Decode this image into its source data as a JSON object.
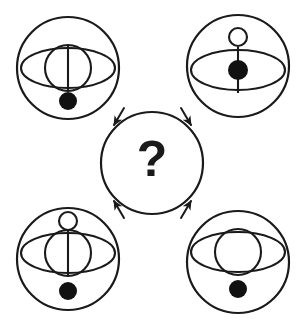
{
  "puzzle": {
    "title": "Visual analogy puzzle",
    "type": "matrix-reasoning",
    "question_mark": "?",
    "canvas": {
      "width": 305,
      "height": 324
    },
    "style": {
      "stroke_color": "#1a1a1a",
      "fill_color": "#1a1a1a",
      "background_color": "#ffffff",
      "stroke_width": 2.1,
      "dot_color": "#111111"
    },
    "center": {
      "name": "answer-circle",
      "label": "?",
      "cx": 152,
      "cy": 163,
      "r": 51
    },
    "arrows": [
      {
        "name": "arrow-from-top-left",
        "x1": 124,
        "y1": 108,
        "x2": 114,
        "y2": 125,
        "direction": "down-right"
      },
      {
        "name": "arrow-from-top-right",
        "x1": 181,
        "y1": 108,
        "x2": 191,
        "y2": 125,
        "direction": "down-left"
      },
      {
        "name": "arrow-from-bottom-left",
        "x1": 124,
        "y1": 218,
        "x2": 114,
        "y2": 201,
        "direction": "up-right"
      },
      {
        "name": "arrow-from-bottom-right",
        "x1": 181,
        "y1": 218,
        "x2": 191,
        "y2": 201,
        "direction": "up-left"
      }
    ],
    "symbols": [
      {
        "name": "symbol-top-left",
        "position": "top-left",
        "outer_circle": {
          "cx": 68,
          "cy": 68,
          "r": 51
        },
        "ellipse": {
          "cx": 68,
          "cy": 68,
          "rx": 47,
          "ry": 20
        },
        "inner_circle": {
          "cx": 68,
          "cy": 68,
          "r": 23,
          "present": true
        },
        "vertical_line": {
          "present": true,
          "x": 68,
          "y1": 45,
          "y2": 91
        },
        "open_circle_top": {
          "present": false,
          "cx": 68,
          "cy": 34,
          "r": 9
        },
        "filled_dot": {
          "present": true,
          "cx": 68,
          "cy": 101,
          "r": 9,
          "location": "below-ellipse"
        },
        "features": [
          "outer-circle",
          "ellipse",
          "inner-circle",
          "vertical-line",
          "dot-below"
        ]
      },
      {
        "name": "symbol-top-right",
        "position": "top-right",
        "outer_circle": {
          "cx": 238,
          "cy": 66,
          "r": 51
        },
        "ellipse": {
          "cx": 238,
          "cy": 70,
          "rx": 47,
          "ry": 20
        },
        "inner_circle": {
          "cx": 238,
          "cy": 70,
          "r": 23,
          "present": false
        },
        "vertical_line": {
          "present": true,
          "x": 238,
          "y1": 47,
          "y2": 93
        },
        "open_circle_top": {
          "present": true,
          "cx": 238,
          "cy": 37,
          "r": 9
        },
        "filled_dot": {
          "present": true,
          "cx": 238,
          "cy": 70,
          "r": 10,
          "location": "ellipse-center"
        },
        "features": [
          "outer-circle",
          "open-circle-top",
          "ellipse",
          "vertical-line",
          "dot-center"
        ]
      },
      {
        "name": "symbol-bottom-left",
        "position": "bottom-left",
        "outer_circle": {
          "cx": 68,
          "cy": 259,
          "r": 51
        },
        "ellipse": {
          "cx": 68,
          "cy": 253,
          "rx": 47,
          "ry": 20
        },
        "inner_circle": {
          "cx": 68,
          "cy": 253,
          "r": 23,
          "present": true
        },
        "vertical_line": {
          "present": true,
          "x": 68,
          "y1": 230,
          "y2": 276
        },
        "open_circle_top": {
          "present": true,
          "cx": 68,
          "cy": 221,
          "r": 9
        },
        "filled_dot": {
          "present": true,
          "cx": 68,
          "cy": 291,
          "r": 9,
          "location": "below-ellipse"
        },
        "features": [
          "outer-circle",
          "open-circle-top",
          "ellipse",
          "inner-circle",
          "vertical-line",
          "dot-below"
        ]
      },
      {
        "name": "symbol-bottom-right",
        "position": "bottom-right",
        "outer_circle": {
          "cx": 238,
          "cy": 262,
          "r": 51
        },
        "ellipse": {
          "cx": 238,
          "cy": 252,
          "rx": 47,
          "ry": 20
        },
        "inner_circle": {
          "cx": 238,
          "cy": 252,
          "r": 23,
          "present": true
        },
        "vertical_line": {
          "present": false,
          "x": 238,
          "y1": 229,
          "y2": 275
        },
        "open_circle_top": {
          "present": false,
          "cx": 238,
          "cy": 220,
          "r": 9
        },
        "filled_dot": {
          "present": true,
          "cx": 238,
          "cy": 289,
          "r": 9,
          "location": "below-ellipse"
        },
        "features": [
          "outer-circle",
          "ellipse",
          "inner-circle",
          "dot-below"
        ]
      }
    ]
  }
}
